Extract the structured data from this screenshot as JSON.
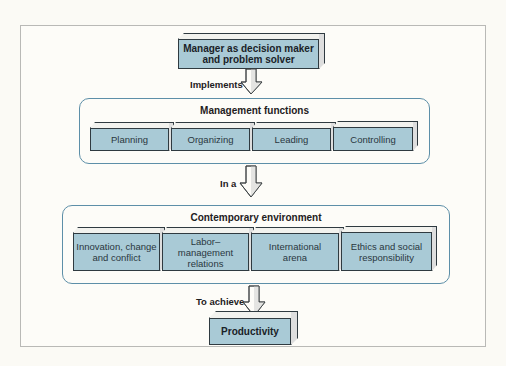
{
  "diagram": {
    "top_box": {
      "line1": "Manager as decision maker",
      "line2": "and problem solver"
    },
    "connectors": [
      {
        "label": "Implements"
      },
      {
        "label": "In a"
      },
      {
        "label": "To achieve"
      }
    ],
    "management_functions": {
      "title": "Management functions",
      "items": [
        {
          "label": "Planning"
        },
        {
          "label": "Organizing"
        },
        {
          "label": "Leading"
        },
        {
          "label": "Controlling"
        }
      ]
    },
    "contemporary_environment": {
      "title": "Contemporary environment",
      "items": [
        {
          "line1": "Innovation, change",
          "line2": "and conflict"
        },
        {
          "line1": "Labor–management",
          "line2": "relations"
        },
        {
          "line1": "International",
          "line2": "arena"
        },
        {
          "line1": "Ethics and social",
          "line2": "responsibility"
        }
      ]
    },
    "bottom_box": {
      "label": "Productivity"
    },
    "colors": {
      "box_fill": "#a9cad6",
      "container_border": "#5d8fa8",
      "background": "#fbfaf5"
    }
  }
}
